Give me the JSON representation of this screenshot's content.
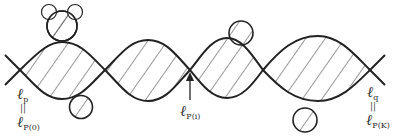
{
  "figure": {
    "type": "diagram",
    "stroke_color": "#222222",
    "hatch_color": "#333333",
    "background": "#ffffff",
    "crossings_x": [
      20,
      105,
      190,
      263,
      370
    ],
    "crossing_y": 70,
    "lens_top_y": [
      42,
      40,
      38,
      36
    ],
    "lens_bottom_y": [
      99,
      101,
      98,
      101
    ]
  },
  "labels": {
    "left_top": {
      "main": "ℓ",
      "sub": "p"
    },
    "left_eq": "||",
    "left_bottom": {
      "main": "ℓ",
      "sub": "P(0)"
    },
    "middle": {
      "main": "ℓ",
      "sub": "P(i)"
    },
    "right_top": {
      "main": "ℓ",
      "sub": "q"
    },
    "right_eq": "||",
    "right_bottom": {
      "main": "ℓ",
      "sub": "P(K)"
    }
  },
  "circles": [
    {
      "name": "top-circle-1",
      "cx": 62,
      "cy": 26,
      "r": 15
    },
    {
      "name": "ear-circle-left",
      "cx": 49,
      "cy": 12,
      "r": 7.5
    },
    {
      "name": "ear-circle-right",
      "cx": 75,
      "cy": 12,
      "r": 7.5
    },
    {
      "name": "bottom-circle-1",
      "cx": 81,
      "cy": 107,
      "r": 11.5
    },
    {
      "name": "top-circle-2",
      "cx": 241,
      "cy": 33,
      "r": 12
    },
    {
      "name": "bottom-circle-2",
      "cx": 305,
      "cy": 120,
      "r": 12
    }
  ]
}
